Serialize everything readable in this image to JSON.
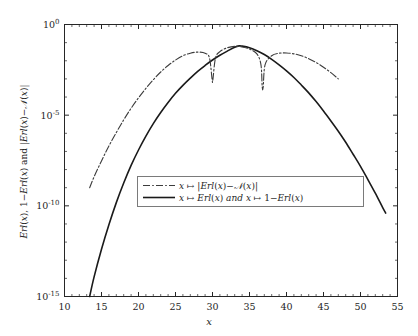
{
  "chart_data": {
    "type": "line",
    "title": "",
    "xlabel": "x",
    "ylabel": "Erl(x), 1-Erl(x) and |Erl(x)-N(x)|",
    "yscale": "log",
    "xlim": [
      10,
      55
    ],
    "ylim": [
      1e-15,
      1
    ],
    "grid": false,
    "xticks": [
      10,
      15,
      20,
      25,
      30,
      35,
      40,
      45,
      50,
      55
    ],
    "xtick_labels": [
      "10",
      "15",
      "20",
      "25",
      "30",
      "35",
      "40",
      "45",
      "50",
      "55"
    ],
    "yticks": [
      1,
      1e-05,
      1e-10,
      1e-15
    ],
    "ytick_labels": [
      "10^0",
      "10^-5",
      "10^-10",
      "10^-15"
    ],
    "ytick_mantissa": [
      "10",
      "10",
      "10",
      "10"
    ],
    "ytick_exponent": [
      "0",
      "-5",
      "-10",
      "-15"
    ],
    "legend_position": "center",
    "series": [
      {
        "name": "erl-normal-difference",
        "label_plain": "x -> |Erl(x)-N(x)|",
        "style": "dash-dot",
        "color": "#3c3c3c",
        "points": [
          [
            13.4,
            1e-09
          ],
          [
            14.0,
            4e-09
          ],
          [
            15.0,
            3e-08
          ],
          [
            16.0,
            2e-07
          ],
          [
            17.0,
            1.1e-06
          ],
          [
            18.0,
            5.5e-06
          ],
          [
            19.0,
            2.4e-05
          ],
          [
            20.0,
            9e-05
          ],
          [
            21.0,
            0.0003
          ],
          [
            22.0,
            0.0009
          ],
          [
            23.0,
            0.0024
          ],
          [
            24.0,
            0.0055
          ],
          [
            25.0,
            0.011
          ],
          [
            26.0,
            0.019
          ],
          [
            27.0,
            0.026
          ],
          [
            28.0,
            0.03
          ],
          [
            29.0,
            0.026
          ],
          [
            29.6,
            0.014
          ],
          [
            29.95,
            0.0009
          ],
          [
            30.05,
            0.0009
          ],
          [
            30.4,
            0.014
          ],
          [
            31.0,
            0.032
          ],
          [
            32.0,
            0.052
          ],
          [
            33.0,
            0.062
          ],
          [
            34.0,
            0.058
          ],
          [
            35.0,
            0.044
          ],
          [
            36.0,
            0.024
          ],
          [
            36.55,
            0.006
          ],
          [
            36.72,
            0.00035
          ],
          [
            36.85,
            0.00035
          ],
          [
            37.1,
            0.006
          ],
          [
            38.0,
            0.019
          ],
          [
            39.0,
            0.026
          ],
          [
            40.0,
            0.027
          ],
          [
            41.0,
            0.024
          ],
          [
            42.0,
            0.019
          ],
          [
            43.0,
            0.013
          ],
          [
            44.0,
            0.008
          ],
          [
            45.0,
            0.0044
          ],
          [
            46.0,
            0.0022
          ],
          [
            47.0,
            0.001
          ]
        ]
      },
      {
        "name": "erl-and-one-minus-erl",
        "label_plain": "x -> Erl(x) and x -> 1-Erl(x)",
        "style": "solid",
        "color": "#1a1a1a",
        "points": [
          [
            13.4,
            1e-15
          ],
          [
            14.0,
            1.2e-14
          ],
          [
            15.0,
            4e-13
          ],
          [
            16.0,
            9e-12
          ],
          [
            17.0,
            1.5e-10
          ],
          [
            18.0,
            1.8e-09
          ],
          [
            19.0,
            1.7e-08
          ],
          [
            20.0,
            1.2e-07
          ],
          [
            21.0,
            7e-07
          ],
          [
            22.0,
            3.4e-06
          ],
          [
            23.0,
            1.4e-05
          ],
          [
            24.0,
            5e-05
          ],
          [
            25.0,
            0.00016
          ],
          [
            26.0,
            0.00044
          ],
          [
            27.0,
            0.0011
          ],
          [
            28.0,
            0.0026
          ],
          [
            29.0,
            0.0055
          ],
          [
            30.0,
            0.011
          ],
          [
            31.0,
            0.02
          ],
          [
            32.0,
            0.034
          ],
          [
            33.0,
            0.056
          ],
          [
            33.6,
            0.066
          ],
          [
            34.0,
            0.064
          ],
          [
            35.0,
            0.052
          ],
          [
            36.0,
            0.036
          ],
          [
            37.0,
            0.022
          ],
          [
            38.0,
            0.012
          ],
          [
            39.0,
            0.006
          ],
          [
            40.0,
            0.0028
          ],
          [
            41.0,
            0.0012
          ],
          [
            42.0,
            0.00046
          ],
          [
            43.0,
            0.00017
          ],
          [
            44.0,
            5.6e-05
          ],
          [
            45.0,
            1.7e-05
          ],
          [
            46.0,
            4.8e-06
          ],
          [
            47.0,
            1.3e-06
          ],
          [
            48.0,
            3.2e-07
          ],
          [
            49.0,
            7e-08
          ],
          [
            50.0,
            1.5e-08
          ],
          [
            51.0,
            2.8e-09
          ],
          [
            52.0,
            5e-10
          ],
          [
            53.0,
            8e-11
          ],
          [
            53.4,
            4e-11
          ]
        ]
      }
    ]
  },
  "axes": {
    "xlabel_text": "x",
    "ylabel_parts": {
      "p1": "Erl",
      "p2": "(",
      "p3": "x",
      "p4": "), 1−",
      "p5": "Erl",
      "p6": "(",
      "p7": "x",
      "p8": ") and |",
      "p9": "Erl",
      "p10": "(",
      "p11": "x",
      "p12": ")−",
      "p13": "𝒩",
      "p14": "(",
      "p15": "x",
      "p16": ")|"
    }
  },
  "legend": {
    "entries": [
      {
        "name": "legend-entry-difference",
        "marker": "dash-dot-line",
        "arg": "x",
        "maps_to": "↦",
        "body": "|Erl(x)−𝒩(x)|"
      },
      {
        "name": "legend-entry-erl",
        "marker": "solid-line",
        "arg": "x",
        "maps_to": "↦",
        "body": "Erl(x) and x ↦ 1−Erl(x)"
      }
    ]
  },
  "colors": {
    "axis": "#262626",
    "solid_curve": "#1a1a1a",
    "dashed_curve": "#3c3c3c",
    "background": "#ffffff",
    "legend_border": "#7a7a7a"
  }
}
